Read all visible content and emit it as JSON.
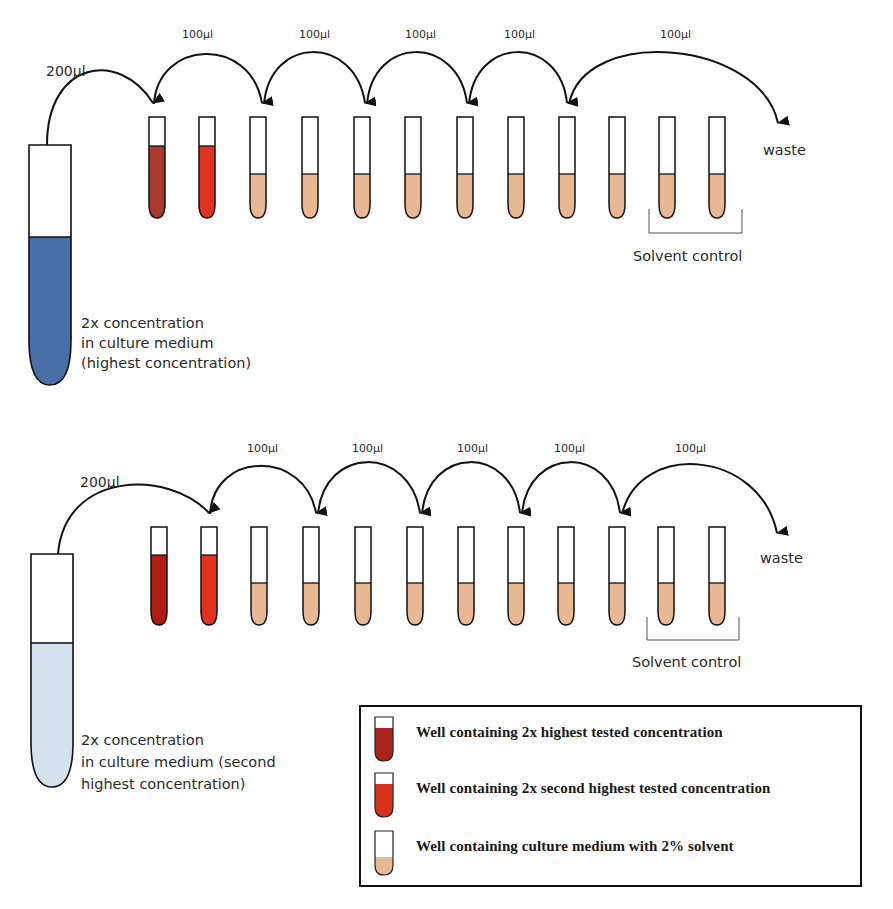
{
  "colors": {
    "dark_red": "#a83a2c",
    "bright_red": "#e0321c",
    "beige": "#e8b894",
    "blue": "#4a6ea8",
    "light_blue": "#d3e2ee",
    "deep_red_lower": "#b01c12",
    "stroke": "#111111"
  },
  "panels": [
    {
      "id": "top",
      "source_tube": {
        "color": "#4a6ea8",
        "label_lines": [
          "2x concentration",
          "in culture medium",
          "(highest concentration)"
        ]
      },
      "transfer_initial": "200µl",
      "transfers": [
        "100µl",
        "100µl",
        "100µl",
        "100µl",
        "100µl"
      ],
      "waste_label": "waste",
      "solvent_control_label": "Solvent control",
      "wells": [
        "dark_red",
        "bright_red",
        "beige",
        "beige",
        "beige",
        "beige",
        "beige",
        "beige",
        "beige",
        "beige",
        "beige",
        "beige"
      ]
    },
    {
      "id": "bottom",
      "source_tube": {
        "color": "#d3e2ee",
        "label_lines": [
          "2x concentration",
          "in culture medium (second",
          "highest concentration)"
        ]
      },
      "transfer_initial": "200µl",
      "transfers": [
        "100µl",
        "100µl",
        "100µl",
        "100µl",
        "100µl"
      ],
      "waste_label": "waste",
      "solvent_control_label": "Solvent control",
      "wells": [
        "deep_red_lower",
        "bright_red",
        "beige",
        "beige",
        "beige",
        "beige",
        "beige",
        "beige",
        "beige",
        "beige",
        "beige",
        "beige"
      ]
    }
  ],
  "legend": {
    "items": [
      {
        "color": "#a8241c",
        "text": "Well containing 2x highest tested concentration"
      },
      {
        "color": "#d8321e",
        "text": "Well containing 2x second highest tested concentration"
      },
      {
        "color": "#e8b894",
        "text": "Well containing culture medium with 2% solvent"
      }
    ]
  }
}
